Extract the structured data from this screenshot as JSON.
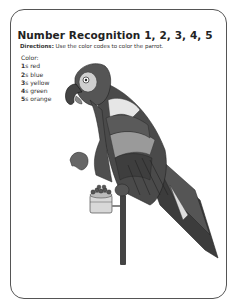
{
  "worksheet": {
    "title": "Number Recognition 1, 2, 3, 4, 5",
    "directions_label": "Directions:",
    "directions_text": " Use the color codes to color the parrot.",
    "legend_heading": "Color:",
    "legend": [
      {
        "num": "1",
        "suffix": "s",
        "color": "red"
      },
      {
        "num": "2",
        "suffix": "s",
        "color": "blue"
      },
      {
        "num": "3",
        "suffix": "s",
        "color": "yellow"
      },
      {
        "num": "4",
        "suffix": "s",
        "color": "green"
      },
      {
        "num": "5",
        "suffix": "s",
        "color": "orange"
      }
    ],
    "illustration": "parrot-on-perch-icon"
  }
}
